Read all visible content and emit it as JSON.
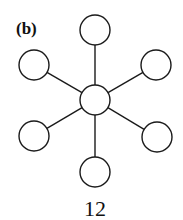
{
  "figure": {
    "panel_label": "(b)",
    "caption": "12"
  },
  "graph": {
    "type": "star",
    "stroke": "#1a1a1a",
    "center": {
      "x": 95,
      "y": 100,
      "r": 15
    },
    "leaves": [
      {
        "name": "top",
        "x": 95,
        "y": 30,
        "r": 15
      },
      {
        "name": "upper-left",
        "x": 34,
        "y": 65,
        "r": 15
      },
      {
        "name": "upper-right",
        "x": 156,
        "y": 65,
        "r": 15
      },
      {
        "name": "lower-left",
        "x": 34,
        "y": 136,
        "r": 15
      },
      {
        "name": "lower-right",
        "x": 157,
        "y": 137,
        "r": 15
      },
      {
        "name": "bottom",
        "x": 95,
        "y": 172,
        "r": 15
      }
    ]
  }
}
